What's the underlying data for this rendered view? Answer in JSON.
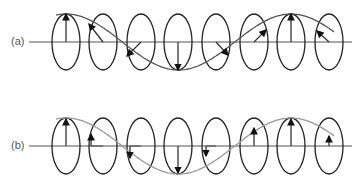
{
  "panels": [
    {
      "label": "(a)",
      "axis_y": 42,
      "wave_color": "#555555",
      "description": "helically rotating vector (wave) — arrows rotate around axis",
      "arrows": [
        {
          "dx": 0,
          "dy": -28
        },
        {
          "dx": -14,
          "dy": -18
        },
        {
          "dx": -14,
          "dy": 14
        },
        {
          "dx": 0,
          "dy": 28
        },
        {
          "dx": 12,
          "dy": 13
        },
        {
          "dx": 12,
          "dy": -12
        },
        {
          "dx": 0,
          "dy": -28
        },
        {
          "dx": -12,
          "dy": -11
        }
      ]
    },
    {
      "label": "(b)",
      "axis_y": 146,
      "wave_color": "#999999",
      "description": "projection — vertical components only",
      "arrows": [
        {
          "dx": 0,
          "dy": -27,
          "off": 0
        },
        {
          "dx": 0,
          "dy": -12,
          "off": -12
        },
        {
          "dx": 0,
          "dy": 12,
          "off": -11
        },
        {
          "dx": 0,
          "dy": 27,
          "off": 0
        },
        {
          "dx": 0,
          "dy": 10,
          "off": -10
        },
        {
          "dx": 0,
          "dy": -18,
          "off": 0
        },
        {
          "dx": 0,
          "dy": -27,
          "off": 0
        },
        {
          "dx": 0,
          "dy": -10,
          "off": 0
        }
      ]
    }
  ],
  "ellipse_centers_x": [
    66,
    103,
    141,
    178,
    216,
    254,
    291,
    329
  ],
  "ellipse_rx": 14,
  "ellipse_ry": 28,
  "colors": {
    "stroke": "#222222",
    "axis": "#555555"
  }
}
